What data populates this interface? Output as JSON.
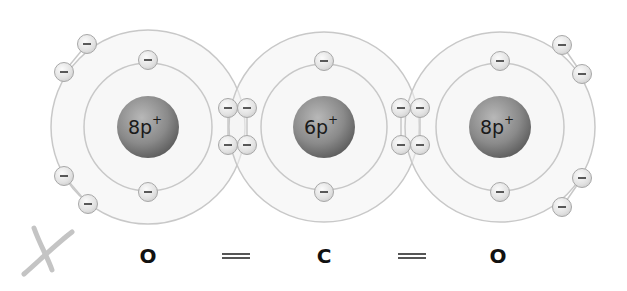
{
  "diagram": {
    "atoms": [
      {
        "id": "oxygen-left",
        "symbol": "O",
        "nucleus_label": "8p",
        "nucleus_charge": "+",
        "center": [
          148,
          127
        ],
        "outer_shell_radius": 97,
        "inner_shell_radius": 64,
        "nucleus_radius": 31,
        "inner_electrons": [
          [
            148,
            60
          ],
          [
            148,
            192
          ]
        ],
        "outer_lone_electrons": [
          [
            87,
            44
          ],
          [
            64,
            72
          ],
          [
            64,
            176
          ],
          [
            88,
            204
          ]
        ]
      },
      {
        "id": "carbon-center",
        "symbol": "C",
        "nucleus_label": "6p",
        "nucleus_charge": "+",
        "center": [
          324,
          127
        ],
        "outer_shell_radius": 95,
        "inner_shell_radius": 63,
        "nucleus_radius": 31,
        "inner_electrons": [
          [
            324,
            61
          ],
          [
            324,
            192
          ]
        ],
        "outer_lone_electrons": []
      },
      {
        "id": "oxygen-right",
        "symbol": "O",
        "nucleus_label": "8p",
        "nucleus_charge": "+",
        "center": [
          500,
          127
        ],
        "outer_shell_radius": 95,
        "inner_shell_radius": 64,
        "nucleus_radius": 31,
        "inner_electrons": [
          [
            500,
            61
          ],
          [
            500,
            192
          ]
        ],
        "outer_lone_electrons": [
          [
            562,
            45
          ],
          [
            582,
            74
          ],
          [
            582,
            178
          ],
          [
            562,
            207
          ]
        ]
      }
    ],
    "shared_electron_pairs": [
      {
        "between": [
          "oxygen-left",
          "carbon-center"
        ],
        "electrons": [
          [
            228,
            108
          ],
          [
            247,
            108
          ],
          [
            228,
            145
          ],
          [
            247,
            145
          ]
        ]
      },
      {
        "between": [
          "carbon-center",
          "oxygen-right"
        ],
        "electrons": [
          [
            401,
            108
          ],
          [
            420,
            108
          ],
          [
            401,
            145
          ],
          [
            420,
            145
          ]
        ]
      }
    ],
    "electron_symbol": "−",
    "formula": {
      "atom_left": "O",
      "bond_left": "=",
      "atom_center": "C",
      "bond_right": "=",
      "atom_right": "O"
    },
    "colors": {
      "shell_fill": "#f2f2f2",
      "shell_stroke": "#c8c8c8",
      "nucleus_light": "#b5b5b5",
      "nucleus_dark": "#5e5e5e",
      "electron_fill": "#e8e8e8",
      "electron_stroke": "#a8a8a8",
      "checkmark": "#bdbdbd"
    },
    "annotation_mark": "handwritten-x-check"
  }
}
